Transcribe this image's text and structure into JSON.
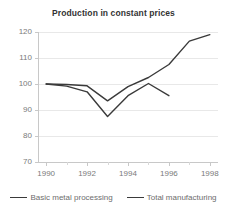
{
  "chart_data": {
    "type": "line",
    "title": "Production in constant prices",
    "xlabel": "",
    "ylabel": "",
    "x": [
      1990,
      1991,
      1992,
      1993,
      1994,
      1995,
      1996,
      1997,
      1998
    ],
    "xlim": [
      1989.6,
      1998.4
    ],
    "ylim": [
      70,
      120
    ],
    "xticks": [
      1990,
      1992,
      1994,
      1996,
      1998
    ],
    "xtick_labels": [
      "1990",
      "1992",
      "1994",
      "1996",
      "1998"
    ],
    "xminor_ticks": [
      1991,
      1993,
      1995,
      1997
    ],
    "yticks": [
      70,
      80,
      90,
      100,
      110,
      120
    ],
    "ytick_labels": [
      "70",
      "80",
      "90",
      "100",
      "110",
      "120"
    ],
    "grid": "horizontal",
    "legend_position": "bottom",
    "series": [
      {
        "name": "Basic metal processing",
        "color": "#3a3a3a",
        "x": [
          1990,
          1991,
          1992,
          1993,
          1994,
          1995,
          1996,
          1997,
          1998
        ],
        "values": [
          100.0,
          99.8,
          99.3,
          93.5,
          99.0,
          102.5,
          107.5,
          116.5,
          119.0
        ]
      },
      {
        "name": "Total manufacturing",
        "color": "#3a3a3a",
        "x": [
          1990,
          1991,
          1992,
          1993,
          1994,
          1995,
          1996
        ],
        "values": [
          100.0,
          99.2,
          97.0,
          87.5,
          95.5,
          100.2,
          95.5
        ]
      }
    ]
  },
  "legend": {
    "entries": [
      {
        "label": "Basic metal processing"
      },
      {
        "label": "Total manufacturing"
      }
    ]
  }
}
